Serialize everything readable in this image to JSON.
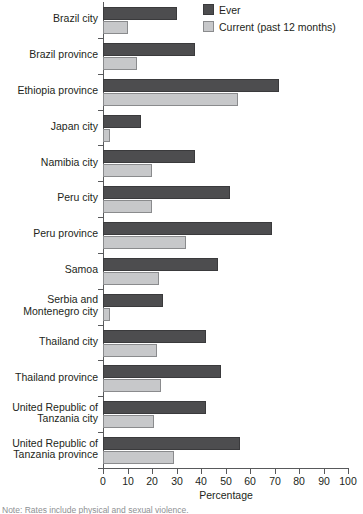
{
  "chart_data": {
    "type": "bar",
    "orientation": "horizontal",
    "title": "",
    "xlabel": "Percentage",
    "ylabel": "",
    "xlim": [
      0,
      100
    ],
    "xticks": [
      0,
      10,
      20,
      30,
      40,
      50,
      60,
      70,
      80,
      90,
      100
    ],
    "grid": false,
    "legend_position": "top-right",
    "categories": [
      "Brazil city",
      "Brazil province",
      "Ethiopia province",
      "Japan city",
      "Namibia city",
      "Peru city",
      "Peru province",
      "Samoa",
      "Serbia and\nMontenegro city",
      "Thailand city",
      "Thailand province",
      "United Republic of\nTanzania city",
      "United Republic of\nTanzania province"
    ],
    "series": [
      {
        "name": "Ever",
        "color": "#4d4d4f",
        "values": [
          30,
          37.5,
          72,
          15.5,
          37.5,
          52,
          69,
          47,
          24.5,
          42,
          48,
          42,
          56
        ]
      },
      {
        "name": "Current (past 12 months)",
        "color": "#c7c8ca",
        "values": [
          10,
          14,
          55,
          3,
          20,
          20,
          34,
          23,
          3,
          22,
          23.5,
          21,
          29
        ]
      }
    ]
  },
  "legend": {
    "items": [
      {
        "label": "Ever",
        "swatch": "ever"
      },
      {
        "label": "Current (past 12 months)",
        "swatch": "current"
      }
    ]
  },
  "footnote": {
    "text": "Note: Rates include physical and sexual violence."
  }
}
